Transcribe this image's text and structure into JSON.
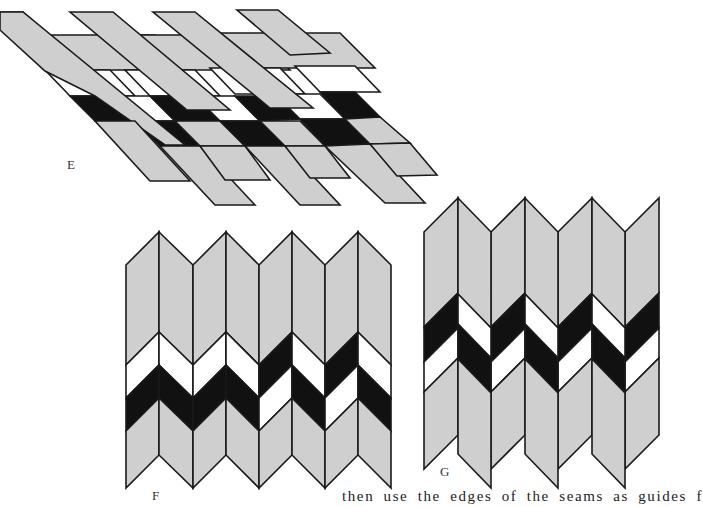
{
  "figures": [
    {
      "id": "E",
      "label": "E",
      "description": "Diagonal strips woven into rows of light gray, white and black parallelograms"
    },
    {
      "id": "F",
      "label": "F",
      "description": "Vertical chevron strips forming zigzag bands of gray, white and black"
    },
    {
      "id": "G",
      "label": "G",
      "description": "Vertical offset parallelogram strips with gray, black and white segments"
    }
  ],
  "colors": {
    "gray": "#cfcfcf",
    "black": "#111111",
    "white": "#ffffff",
    "outline": "#1a1a1a"
  },
  "caption": "then use the edges of the seams as guides f"
}
